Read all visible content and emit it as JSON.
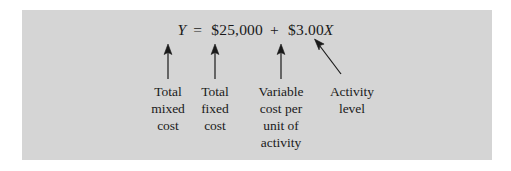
{
  "figure": {
    "panel_color": "#d5d5d5",
    "page_background": "#ffffff",
    "ink_color": "#1a1a1a",
    "equation": {
      "dependent_variable": "Y",
      "equals": "=",
      "fixed_cost": "$25,000",
      "plus": "+",
      "variable_rate": "$3.00",
      "independent_variable": "X"
    },
    "labels": [
      {
        "id": "total-mixed-cost",
        "lines": [
          "Total",
          "mixed",
          "cost"
        ],
        "points_to": "Y"
      },
      {
        "id": "total-fixed-cost",
        "lines": [
          "Total",
          "fixed",
          "cost"
        ],
        "points_to": "$25,000"
      },
      {
        "id": "variable-cost-per-unit",
        "lines": [
          "Variable",
          "cost per",
          "unit of",
          "activity"
        ],
        "points_to": "$3.00"
      },
      {
        "id": "activity-level",
        "lines": [
          "Activity",
          "level"
        ],
        "points_to": "X"
      }
    ],
    "arrows": [
      {
        "id": "arrow-to-y",
        "kind": "vertical-up"
      },
      {
        "id": "arrow-to-fixed-cost",
        "kind": "vertical-up"
      },
      {
        "id": "arrow-to-variable-rate",
        "kind": "vertical-up"
      },
      {
        "id": "arrow-to-activity-variable",
        "kind": "diagonal-up-left"
      }
    ]
  }
}
